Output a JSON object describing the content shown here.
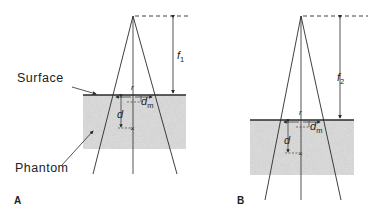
{
  "figure": {
    "panel_a": {
      "letter": "A",
      "surface_label": "Surface",
      "phantom_label": "Phantom",
      "distance_label": "f",
      "distance_subscript": "1",
      "depth_label": "d",
      "dmax_label": "d",
      "dmax_subscript": "m",
      "field_label": "r"
    },
    "panel_b": {
      "letter": "B",
      "distance_label": "f",
      "distance_subscript": "2",
      "depth_label": "d",
      "dmax_label": "d",
      "dmax_subscript": "m",
      "field_label": "r"
    },
    "colors": {
      "line": "#2a2a2a",
      "phantom_fill": "#d8d8d8"
    }
  }
}
